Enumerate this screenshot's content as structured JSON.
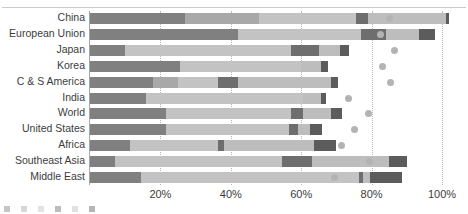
{
  "chart_data": {
    "type": "bar",
    "orientation": "horizontal",
    "stacked": true,
    "title": "",
    "xlabel": "",
    "ylabel": "",
    "xlim": [
      0,
      100
    ],
    "grid": true,
    "legend_position": "bottom",
    "categories": [
      "China",
      "European Union",
      "Japan",
      "Korea",
      "C & S America",
      "India",
      "World",
      "United States",
      "Africa",
      "Southeast Asia",
      "Middle East"
    ],
    "tick_labels": [
      "20%",
      "40%",
      "60%",
      "80%",
      "100%"
    ],
    "tick_values": [
      20,
      40,
      60,
      80,
      100
    ],
    "series": [
      {
        "name": "series-1",
        "color": "#808080",
        "values": [
          27.0,
          42.0,
          10.0,
          25.5,
          18.0,
          16.0,
          21.5,
          21.5,
          11.5,
          7.0,
          14.5
        ]
      },
      {
        "name": "series-2",
        "color": "#a8a8a8",
        "values": [
          21.0,
          0.0,
          0.0,
          0.0,
          7.0,
          0.0,
          0.0,
          0.0,
          0.0,
          0.0,
          0.0
        ]
      },
      {
        "name": "series-3",
        "color": "#c3c3c3",
        "values": [
          27.5,
          35.0,
          47.0,
          34.5,
          11.5,
          44.5,
          35.5,
          35.0,
          25.0,
          47.5,
          62.0
        ]
      },
      {
        "name": "series-4",
        "color": "#6e6e6e",
        "values": [
          3.5,
          7.0,
          8.0,
          0.0,
          5.5,
          0.0,
          3.5,
          2.5,
          1.5,
          8.5,
          1.0
        ]
      },
      {
        "name": "series-5",
        "color": "#bdbdbd",
        "values": [
          22.0,
          9.5,
          6.0,
          5.5,
          26.5,
          5.0,
          8.0,
          3.5,
          25.5,
          22.0,
          2.0
        ]
      },
      {
        "name": "series-6",
        "color": "#5c5c5c",
        "values": [
          1.0,
          4.5,
          2.5,
          2.0,
          2.0,
          1.5,
          3.0,
          3.5,
          6.5,
          5.0,
          9.0
        ]
      }
    ],
    "markers": {
      "name": "marker-series",
      "color": "#b3b3b3",
      "shape": "circle",
      "values": [
        85.0,
        82.5,
        86.5,
        83.0,
        85.5,
        73.5,
        79.0,
        75.0,
        71.5,
        79.5,
        69.5
      ]
    },
    "totals": [
      102.0,
      98.0,
      73.5,
      67.5,
      70.5,
      67.0,
      71.5,
      66.0,
      70.0,
      90.0,
      88.5
    ]
  },
  "legend": {
    "items": [
      {
        "label": "",
        "color": "#808080"
      },
      {
        "label": "",
        "color": "#a8a8a8"
      },
      {
        "label": "",
        "color": "#c3c3c3"
      },
      {
        "label": "",
        "color": "#6e6e6e"
      },
      {
        "label": "",
        "color": "#bdbdbd"
      },
      {
        "label": "",
        "color": "#5c5c5c"
      }
    ]
  }
}
